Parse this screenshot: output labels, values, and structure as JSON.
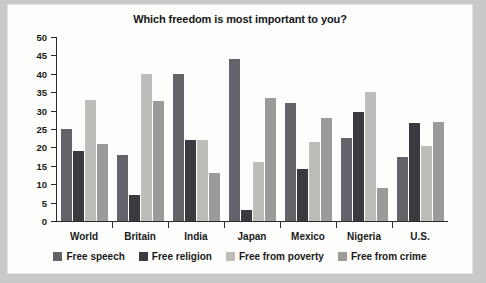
{
  "chart_data": {
    "type": "bar",
    "title": "Which freedom is most important to you?",
    "xlabel": "",
    "ylabel": "",
    "ylim": [
      0,
      50
    ],
    "yticks": [
      0,
      5,
      10,
      15,
      20,
      25,
      30,
      35,
      40,
      45,
      50
    ],
    "grid": false,
    "legend_position": "bottom",
    "categories": [
      "World",
      "Britain",
      "India",
      "Japan",
      "Mexico",
      "Nigeria",
      "U.S."
    ],
    "series": [
      {
        "name": "Free speech",
        "color": "#63636a",
        "values": [
          25,
          18,
          40,
          44,
          32,
          22.5,
          17.5
        ]
      },
      {
        "name": "Free religion",
        "color": "#3a3a40",
        "values": [
          19,
          7,
          22,
          3,
          14,
          29.5,
          26.5
        ]
      },
      {
        "name": "Free from poverty",
        "color": "#bcbcb9",
        "values": [
          33,
          40,
          22,
          16,
          21.5,
          35,
          20.5
        ]
      },
      {
        "name": "Free from crime",
        "color": "#9b9b9b",
        "values": [
          21,
          32.5,
          13,
          33.5,
          28,
          9,
          27
        ]
      }
    ]
  }
}
